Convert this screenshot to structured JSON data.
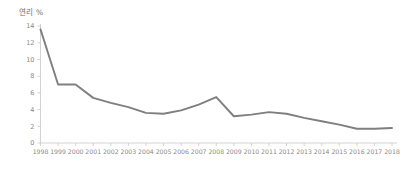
{
  "chart_data": {
    "type": "line",
    "title": "연리 %",
    "xlabel": "",
    "ylabel": "연리 %",
    "categories": [
      "1998",
      "1999",
      "2000",
      "2001",
      "2002",
      "2003",
      "2004",
      "2005",
      "2006",
      "2007",
      "2008",
      "2009",
      "2010",
      "2011",
      "2012",
      "2013",
      "2014",
      "2015",
      "2016",
      "2017",
      "2018"
    ],
    "values": [
      13.6,
      7.0,
      7.0,
      5.4,
      4.8,
      4.3,
      3.6,
      3.5,
      3.9,
      4.6,
      5.5,
      3.2,
      3.4,
      3.7,
      3.5,
      3.0,
      2.6,
      2.2,
      1.7,
      1.7,
      1.8
    ],
    "ylim": [
      0,
      14
    ],
    "yticks": [
      0,
      2,
      4,
      6,
      8,
      10,
      12,
      14
    ],
    "ytick_labels": [
      "0",
      "2",
      "4",
      "6",
      "8",
      "10",
      "12",
      "14"
    ],
    "grid": false,
    "legend": false,
    "legend_position": "none",
    "series": [
      {
        "name": "연리 %",
        "color": "#7f7f7f",
        "values": [
          13.6,
          7.0,
          7.0,
          5.4,
          4.8,
          4.3,
          3.6,
          3.5,
          3.9,
          4.6,
          5.5,
          3.2,
          3.4,
          3.7,
          3.5,
          3.0,
          2.6,
          2.2,
          1.7,
          1.7,
          1.8
        ]
      }
    ]
  },
  "colors": {
    "line": "#7f7f7f",
    "axis": "#c8c8c8",
    "tick_text": "#8a8a8a",
    "title_text": "#6e6e6e",
    "background": "#ffffff"
  }
}
